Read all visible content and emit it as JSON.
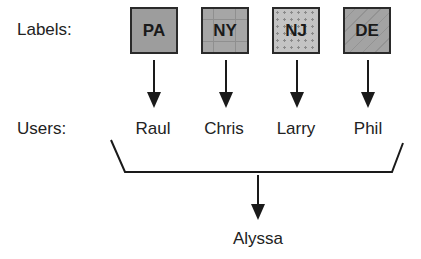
{
  "diagram": {
    "labels_row_title": "Labels:",
    "users_row_title": "Users:",
    "labels": [
      {
        "text": "PA",
        "pattern": "solid-gray"
      },
      {
        "text": "NY",
        "pattern": "crosshatch-gray"
      },
      {
        "text": "NJ",
        "pattern": "dotted-light-gray"
      },
      {
        "text": "DE",
        "pattern": "diagonal-stripe-gray"
      }
    ],
    "users": [
      "Raul",
      "Chris",
      "Larry",
      "Phil"
    ],
    "aggregate_target": "Alyssa",
    "colors": {
      "line": "#1a1a1a",
      "box_border": "#2a2a2a",
      "box_fill": "#9d9d9d",
      "text": "#222222"
    }
  }
}
